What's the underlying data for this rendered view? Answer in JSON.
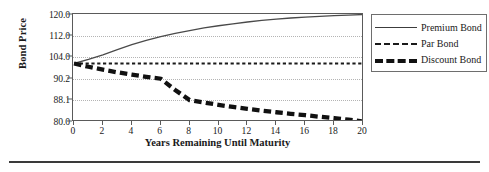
{
  "chart_data": {
    "type": "line",
    "title": "",
    "xlabel": "Years Remaining Until Maturity",
    "ylabel": "Bond Price",
    "xlim": [
      0,
      20
    ],
    "xticks": [
      0,
      2,
      4,
      6,
      8,
      10,
      12,
      14,
      16,
      18,
      20
    ],
    "xtick_labels": [
      "0",
      "2",
      "4",
      "6",
      "8",
      "10",
      "12",
      "14",
      "16",
      "18",
      "20"
    ],
    "yticks_labels": [
      "120.0",
      "112.0",
      "104.0",
      "90.2",
      "88.1",
      "80.0"
    ],
    "ylim": [
      80.0,
      120.0
    ],
    "grid": true,
    "legend_position": "right",
    "x": [
      0,
      1,
      2,
      3,
      4,
      5,
      6,
      7,
      8,
      9,
      10,
      11,
      12,
      13,
      14,
      15,
      16,
      17,
      18,
      19,
      20
    ],
    "series": [
      {
        "name": "Premium Bond",
        "style": "solid",
        "values": [
          100.0,
          102.6,
          104.9,
          106.9,
          108.7,
          110.3,
          111.7,
          112.9,
          114.0,
          115.0,
          115.8,
          116.5,
          117.2,
          117.8,
          118.3,
          118.7,
          119.0,
          119.3,
          119.6,
          119.8,
          120.0
        ]
      },
      {
        "name": "Par Bond",
        "style": "fine-dashed",
        "values": [
          100.0,
          100.0,
          100.0,
          100.0,
          100.0,
          100.0,
          100.0,
          100.0,
          100.0,
          100.0,
          100.0,
          100.0,
          100.0,
          100.0,
          100.0,
          100.0,
          100.0,
          100.0,
          100.0,
          100.0,
          100.0
        ]
      },
      {
        "name": "Discount Bond",
        "style": "thick-dashed",
        "values": [
          100.0,
          97.9,
          96.0,
          94.3,
          92.8,
          91.4,
          90.2,
          89.1,
          88.1,
          87.2,
          86.3,
          85.5,
          84.8,
          84.1,
          83.5,
          82.9,
          82.4,
          81.8,
          81.3,
          80.7,
          80.0
        ]
      }
    ]
  },
  "legend": {
    "items": [
      {
        "label": "Premium Bond"
      },
      {
        "label": "Par Bond"
      },
      {
        "label": "Discount Bond"
      }
    ]
  }
}
